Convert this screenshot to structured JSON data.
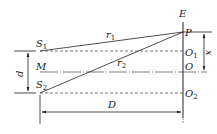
{
  "diagram": {
    "type": "double-slit-geometry",
    "labels": {
      "E": "E",
      "P": "P",
      "O1": "O",
      "O1_sub": "1",
      "O": "O",
      "O2": "O",
      "O2_sub": "2",
      "S1": "S",
      "S1_sub": "1",
      "S2": "S",
      "S2_sub": "2",
      "M": "M",
      "r1": "r",
      "r1_sub": "1",
      "r2": "r",
      "r2_sub": "2",
      "d": "d",
      "D": "D",
      "x": "x"
    },
    "colors": {
      "line": "#222222",
      "dashed": "#555555",
      "background": "#ffffff"
    }
  }
}
